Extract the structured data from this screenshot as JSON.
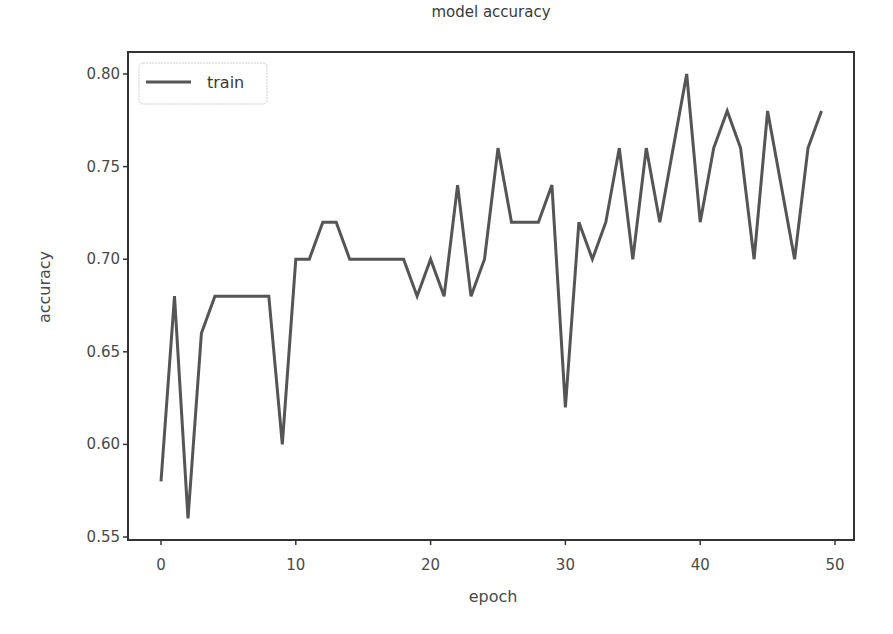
{
  "chart_data": {
    "type": "line",
    "title": "model accuracy",
    "xlabel": "epoch",
    "ylabel": "accuracy",
    "xlim": [
      -2.5,
      51.5
    ],
    "ylim": [
      0.548,
      0.815
    ],
    "xticks": [
      0,
      10,
      20,
      30,
      40,
      50
    ],
    "xtick_labels": [
      "0",
      "10",
      "20",
      "30",
      "40",
      "50"
    ],
    "yticks": [
      0.55,
      0.6,
      0.65,
      0.7,
      0.75,
      0.8
    ],
    "ytick_labels": [
      "0.55",
      "0.60",
      "0.65",
      "0.70",
      "0.75",
      "0.80"
    ],
    "grid": false,
    "legend_position": "upper left",
    "series": [
      {
        "name": "train",
        "color": "#555555",
        "x": [
          0,
          1,
          2,
          3,
          4,
          5,
          6,
          7,
          8,
          9,
          10,
          11,
          12,
          13,
          14,
          15,
          16,
          17,
          18,
          19,
          20,
          21,
          22,
          23,
          24,
          25,
          26,
          27,
          28,
          29,
          30,
          31,
          32,
          33,
          34,
          35,
          36,
          37,
          38,
          39,
          40,
          41,
          42,
          43,
          44,
          45,
          46,
          47,
          48,
          49
        ],
        "values": [
          0.58,
          0.68,
          0.56,
          0.66,
          0.68,
          0.68,
          0.68,
          0.68,
          0.68,
          0.6,
          0.7,
          0.7,
          0.72,
          0.72,
          0.7,
          0.7,
          0.7,
          0.7,
          0.7,
          0.68,
          0.7,
          0.68,
          0.74,
          0.68,
          0.7,
          0.76,
          0.72,
          0.72,
          0.72,
          0.74,
          0.62,
          0.72,
          0.7,
          0.72,
          0.76,
          0.7,
          0.76,
          0.72,
          0.76,
          0.8,
          0.72,
          0.76,
          0.78,
          0.76,
          0.7,
          0.78,
          0.74,
          0.7,
          0.76,
          0.78
        ]
      }
    ]
  },
  "colors": {
    "line": "#555555",
    "axis": "#333333",
    "legend_border": "#cccccc"
  }
}
